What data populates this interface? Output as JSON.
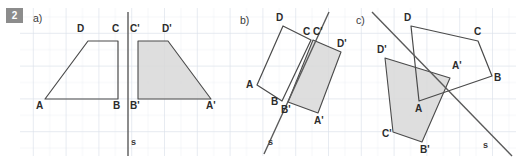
{
  "exercise": {
    "number": "2",
    "parts": [
      {
        "key": "a",
        "label": "a)"
      },
      {
        "key": "b",
        "label": "b)"
      },
      {
        "key": "c",
        "label": "c)"
      }
    ]
  },
  "canvas": {
    "width": 516,
    "height": 162,
    "background": "#ffffff"
  },
  "grid": {
    "x": 20,
    "y": 8,
    "width": 496,
    "height": 148,
    "cell": 16.4,
    "minor_color": "#e8ecf2",
    "major_color": "#d4dae4",
    "major_every": 2
  },
  "style": {
    "shape_stroke": "#4a4a4a",
    "image_fill": "#d8d8d8",
    "image_fill_opacity": 0.85,
    "axis_color": "#5a5a5a",
    "label_color": "#2b2b2b",
    "badge_bg": "#8c8c8c",
    "badge_fg": "#ffffff"
  },
  "figures": [
    {
      "key": "a",
      "part_label": "a)",
      "part_label_pos": {
        "x": 33,
        "y": 12
      },
      "axis": {
        "name": "s",
        "x1": 128,
        "y1": 12,
        "x2": 128,
        "y2": 156,
        "label": "s",
        "label_pos": {
          "x": 131,
          "y": 137
        }
      },
      "object": {
        "name": "ABCD",
        "points": [
          {
            "name": "A",
            "x": 45,
            "y": 99,
            "label": "A",
            "label_pos": {
              "x": 36,
              "y": 100
            }
          },
          {
            "name": "B",
            "x": 118,
            "y": 99,
            "label": "B",
            "label_pos": {
              "x": 113,
              "y": 100
            }
          },
          {
            "name": "C",
            "x": 118,
            "y": 41,
            "label": "C",
            "label_pos": {
              "x": 112,
              "y": 23
            }
          },
          {
            "name": "D",
            "x": 88,
            "y": 41,
            "label": "D",
            "label_pos": {
              "x": 77,
              "y": 23
            }
          }
        ]
      },
      "image": {
        "name": "A'B'C'D'",
        "points": [
          {
            "name": "A'",
            "x": 211,
            "y": 99,
            "label": "A'",
            "label_pos": {
              "x": 206,
              "y": 100
            }
          },
          {
            "name": "B'",
            "x": 138,
            "y": 99,
            "label": "B'",
            "label_pos": {
              "x": 130,
              "y": 100
            }
          },
          {
            "name": "C'",
            "x": 138,
            "y": 41,
            "label": "C'",
            "label_pos": {
              "x": 130,
              "y": 23
            }
          },
          {
            "name": "D'",
            "x": 168,
            "y": 41,
            "label": "D'",
            "label_pos": {
              "x": 162,
              "y": 23
            }
          }
        ]
      }
    },
    {
      "key": "b",
      "part_label": "b)",
      "part_label_pos": {
        "x": 240,
        "y": 14
      },
      "axis": {
        "name": "s",
        "x1": 329,
        "y1": 12,
        "x2": 264,
        "y2": 154,
        "label": "s",
        "label_pos": {
          "x": 268,
          "y": 137
        }
      },
      "object": {
        "name": "ABCD",
        "points": [
          {
            "name": "A",
            "x": 257,
            "y": 85,
            "label": "A",
            "label_pos": {
              "x": 246,
              "y": 79
            }
          },
          {
            "name": "B",
            "x": 282,
            "y": 101,
            "label": "B",
            "label_pos": {
              "x": 271,
              "y": 96
            }
          },
          {
            "name": "C",
            "x": 311,
            "y": 40,
            "label": "C",
            "label_pos": {
              "x": 303,
              "y": 26
            }
          },
          {
            "name": "D",
            "x": 283,
            "y": 26,
            "label": "D",
            "label_pos": {
              "x": 276,
              "y": 12
            }
          }
        ]
      },
      "image": {
        "name": "A'B'C'D'",
        "points": [
          {
            "name": "A'",
            "x": 318,
            "y": 113,
            "label": "A'",
            "label_pos": {
              "x": 314,
              "y": 115
            }
          },
          {
            "name": "B'",
            "x": 288,
            "y": 102,
            "label": "B'",
            "label_pos": {
              "x": 281,
              "y": 104
            }
          },
          {
            "name": "C'",
            "x": 313,
            "y": 40,
            "label": "C'",
            "label_pos": {
              "x": 313,
              "y": 26
            }
          },
          {
            "name": "D'",
            "x": 341,
            "y": 52,
            "label": "D'",
            "label_pos": {
              "x": 337,
              "y": 38
            }
          }
        ]
      }
    },
    {
      "key": "c",
      "part_label": "c)",
      "part_label_pos": {
        "x": 356,
        "y": 14
      },
      "axis": {
        "name": "s",
        "x1": 372,
        "y1": 12,
        "x2": 512,
        "y2": 156,
        "label": "s",
        "label_pos": {
          "x": 483,
          "y": 140
        }
      },
      "object": {
        "name": "ABCD",
        "points": [
          {
            "name": "A",
            "x": 419,
            "y": 101,
            "label": "A",
            "label_pos": {
              "x": 415,
              "y": 103
            }
          },
          {
            "name": "B",
            "x": 492,
            "y": 76,
            "label": "B",
            "label_pos": {
              "x": 494,
              "y": 72
            }
          },
          {
            "name": "C",
            "x": 478,
            "y": 41,
            "label": "C",
            "label_pos": {
              "x": 474,
              "y": 26
            }
          },
          {
            "name": "D",
            "x": 411,
            "y": 26,
            "label": "D",
            "label_pos": {
              "x": 404,
              "y": 12
            }
          }
        ]
      },
      "image": {
        "name": "A'B'C'D'",
        "points": [
          {
            "name": "A'",
            "x": 450,
            "y": 78,
            "label": "A'",
            "label_pos": {
              "x": 452,
              "y": 60
            }
          },
          {
            "name": "B'",
            "x": 422,
            "y": 142,
            "label": "B'",
            "label_pos": {
              "x": 420,
              "y": 144
            }
          },
          {
            "name": "C'",
            "x": 393,
            "y": 132,
            "label": "C'",
            "label_pos": {
              "x": 382,
              "y": 128
            }
          },
          {
            "name": "D'",
            "x": 385,
            "y": 58,
            "label": "D'",
            "label_pos": {
              "x": 377,
              "y": 44
            }
          }
        ]
      }
    }
  ]
}
